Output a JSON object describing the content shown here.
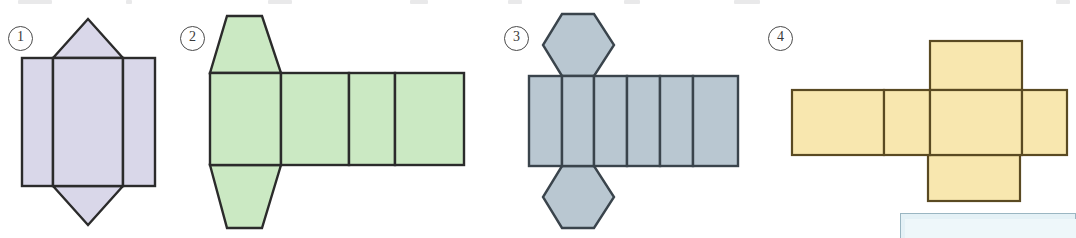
{
  "page": {
    "width": 1076,
    "height": 238,
    "background": "#ffffff"
  },
  "colors": {
    "lavender_fill": "#d9d7e9",
    "green_fill": "#cbe9c3",
    "bluegrey_fill": "#b9c7d1",
    "yellow_fill": "#f8e7af",
    "outline_dark": "#2b2b2b",
    "outline_brown": "#5a4a22",
    "label_ink": "#3a3a3a",
    "blue_panel": "#e4f1f6",
    "blue_panel_border": "#9ab6c2"
  },
  "figures": [
    {
      "id": "fig-1",
      "number": "1",
      "name": "triangular-prism-net",
      "fill": "#d9d7e9",
      "stroke": "#2b2b2b",
      "faces": 5,
      "rect_count": 3,
      "triangle_count": 2,
      "caption": "Net of a triangular prism: three rectangles side by side with a triangle above and below the middle rectangle"
    },
    {
      "id": "fig-2",
      "number": "2",
      "name": "trapezoidal-prism-net",
      "fill": "#cbe9c3",
      "stroke": "#2b2b2b",
      "faces": 6,
      "rect_count": 4,
      "trapezoid_count": 2,
      "caption": "Net of a trapezoidal prism: four rectangles in a row with a trapezoid above and below the first rectangle"
    },
    {
      "id": "fig-3",
      "number": "3",
      "name": "hexagonal-prism-net",
      "fill": "#b9c7d1",
      "stroke": "#3a444c",
      "faces": 8,
      "rect_count": 6,
      "hexagon_count": 2,
      "caption": "Net of a hexagonal prism: six rectangles in a row with a hexagon above and below the second rectangle"
    },
    {
      "id": "fig-4",
      "number": "4",
      "name": "cuboid-net",
      "fill": "#f8e7af",
      "stroke": "#5a4a22",
      "faces": 6,
      "rect_count": 6,
      "caption": "Net of a cuboid arranged as a cross: a row of four rectangles with one rectangle above and one below the third"
    }
  ],
  "blue_panel": {
    "name": "callout-panel",
    "visible_portion": "top edge only, cropped by page bottom"
  },
  "top_artifacts": [
    {
      "x": 18,
      "w": 34
    },
    {
      "x": 126,
      "w": 6
    },
    {
      "x": 268,
      "w": 24
    },
    {
      "x": 734,
      "w": 26
    },
    {
      "x": 1134,
      "w": 20
    }
  ]
}
